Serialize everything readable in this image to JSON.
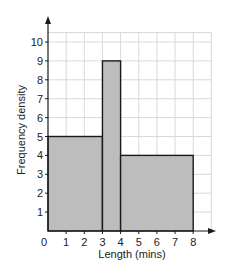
{
  "chart_data": {
    "type": "histogram",
    "title": "",
    "xlabel": "Length (mins)",
    "ylabel": "Frequency density",
    "xlim": [
      0,
      9
    ],
    "ylim": [
      0,
      10.5
    ],
    "grid": true,
    "legend": null,
    "x_ticks": [
      "0",
      "1",
      "2",
      "3",
      "4",
      "5",
      "6",
      "7",
      "8"
    ],
    "y_ticks": [
      "1",
      "2",
      "3",
      "4",
      "5",
      "6",
      "7",
      "8",
      "9",
      "10"
    ],
    "bins": [
      {
        "x_start": 0,
        "x_end": 3,
        "frequency_density": 5
      },
      {
        "x_start": 3,
        "x_end": 4,
        "frequency_density": 9
      },
      {
        "x_start": 4,
        "x_end": 8,
        "frequency_density": 4
      }
    ],
    "categories": [
      "0-3",
      "3-4",
      "4-8"
    ],
    "values": [
      5,
      9,
      4
    ]
  },
  "colors": {
    "bar_fill": "#bdbdbd",
    "bar_stroke": "#1a1a1a",
    "grid": "#d9d9d9",
    "axis": "#1a1a1a",
    "background": "#ffffff"
  }
}
